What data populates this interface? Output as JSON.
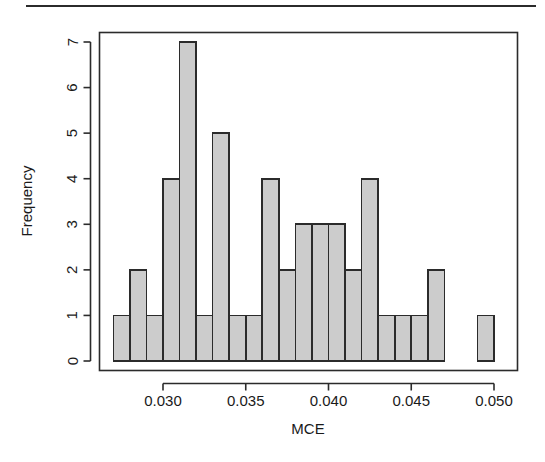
{
  "figure": {
    "background_color": "#ffffff",
    "top_rule": true
  },
  "chart_data": {
    "type": "bar",
    "subtype": "histogram",
    "title": "",
    "xlabel": "MCE",
    "ylabel": "Frequency",
    "xlim": [
      0.0265,
      0.0505
    ],
    "ylim": [
      0,
      7.2
    ],
    "grid": false,
    "legend": null,
    "bin_width": 0.001,
    "bar_fill_color": "#cccccc",
    "bar_edge_color": "#2b2b2b",
    "x_ticks": [
      0.03,
      0.035,
      0.04,
      0.045,
      0.05
    ],
    "x_tick_labels": [
      "0.030",
      "0.035",
      "0.040",
      "0.045",
      "0.050"
    ],
    "y_ticks": [
      0,
      1,
      2,
      3,
      4,
      5,
      6,
      7
    ],
    "y_tick_labels": [
      "0",
      "1",
      "2",
      "3",
      "4",
      "5",
      "6",
      "7"
    ],
    "bin_edges": [
      0.027,
      0.028,
      0.029,
      0.03,
      0.031,
      0.032,
      0.033,
      0.034,
      0.035,
      0.036,
      0.037,
      0.038,
      0.039,
      0.04,
      0.041,
      0.042,
      0.043,
      0.044,
      0.045,
      0.046,
      0.047,
      0.048,
      0.049,
      0.05
    ],
    "bins": [
      {
        "start": 0.027,
        "end": 0.028,
        "count": 1
      },
      {
        "start": 0.028,
        "end": 0.029,
        "count": 2
      },
      {
        "start": 0.029,
        "end": 0.03,
        "count": 1
      },
      {
        "start": 0.03,
        "end": 0.031,
        "count": 4
      },
      {
        "start": 0.031,
        "end": 0.032,
        "count": 7
      },
      {
        "start": 0.032,
        "end": 0.033,
        "count": 1
      },
      {
        "start": 0.033,
        "end": 0.034,
        "count": 5
      },
      {
        "start": 0.034,
        "end": 0.035,
        "count": 1
      },
      {
        "start": 0.035,
        "end": 0.036,
        "count": 1
      },
      {
        "start": 0.036,
        "end": 0.037,
        "count": 4
      },
      {
        "start": 0.037,
        "end": 0.038,
        "count": 2
      },
      {
        "start": 0.038,
        "end": 0.039,
        "count": 3
      },
      {
        "start": 0.039,
        "end": 0.04,
        "count": 3
      },
      {
        "start": 0.04,
        "end": 0.041,
        "count": 3
      },
      {
        "start": 0.041,
        "end": 0.042,
        "count": 2
      },
      {
        "start": 0.042,
        "end": 0.043,
        "count": 4
      },
      {
        "start": 0.043,
        "end": 0.044,
        "count": 1
      },
      {
        "start": 0.044,
        "end": 0.045,
        "count": 1
      },
      {
        "start": 0.045,
        "end": 0.046,
        "count": 1
      },
      {
        "start": 0.046,
        "end": 0.047,
        "count": 2
      },
      {
        "start": 0.047,
        "end": 0.048,
        "count": 0
      },
      {
        "start": 0.048,
        "end": 0.049,
        "count": 0
      },
      {
        "start": 0.049,
        "end": 0.05,
        "count": 1
      }
    ],
    "total_count": 50
  }
}
